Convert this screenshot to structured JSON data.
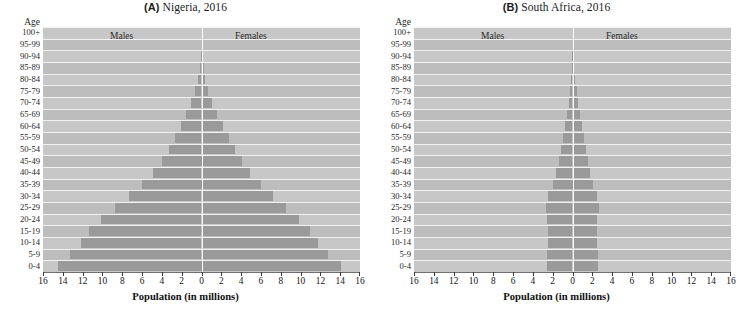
{
  "figure": {
    "x_axis_title": "Population (in millions)",
    "age_axis_title": "Age",
    "males_label": "Males",
    "females_label": "Females",
    "age_groups": [
      "100+",
      "95-99",
      "90-94",
      "85-89",
      "80-84",
      "75-79",
      "70-74",
      "65-69",
      "60-64",
      "55-59",
      "50-54",
      "45-49",
      "40-44",
      "35-39",
      "30-34",
      "25-29",
      "20-24",
      "15-19",
      "10-14",
      "5-9",
      "0-4"
    ],
    "x_ticks": [
      16,
      14,
      12,
      10,
      8,
      6,
      4,
      2,
      0,
      2,
      4,
      6,
      8,
      10,
      12,
      14,
      16
    ],
    "colors": {
      "bar": "#9a9a9a",
      "plot_background": "#c4c4c4",
      "gridline": "#f2f2f2",
      "centerline": "#fdfdfd",
      "text": "#141414"
    }
  },
  "chart_data": [
    {
      "type": "bar",
      "subtype": "population-pyramid",
      "panel": "A",
      "title": "(A) Nigeria, 2016",
      "country": "Nigeria",
      "year": 2016,
      "xlabel": "Population (in millions)",
      "ylabel": "Age",
      "xlim": [
        -16,
        16
      ],
      "xlim_display": [
        16,
        0,
        16
      ],
      "grid": true,
      "legend_position": "inside-top",
      "categories": [
        "100+",
        "95-99",
        "90-94",
        "85-89",
        "80-84",
        "75-79",
        "70-74",
        "65-69",
        "60-64",
        "55-59",
        "50-54",
        "45-49",
        "40-44",
        "35-39",
        "30-34",
        "25-29",
        "20-24",
        "15-19",
        "10-14",
        "5-9",
        "0-4"
      ],
      "series": [
        {
          "name": "Males",
          "values": [
            0.01,
            0.03,
            0.08,
            0.18,
            0.35,
            0.65,
            1.05,
            1.55,
            2.1,
            2.7,
            3.3,
            4.0,
            4.9,
            6.0,
            7.3,
            8.7,
            10.1,
            11.4,
            12.2,
            13.3,
            14.5
          ]
        },
        {
          "name": "Females",
          "values": [
            0.01,
            0.04,
            0.1,
            0.22,
            0.4,
            0.7,
            1.1,
            1.6,
            2.15,
            2.75,
            3.35,
            4.05,
            4.9,
            6.0,
            7.2,
            8.5,
            9.8,
            11.0,
            11.8,
            12.8,
            14.1
          ]
        }
      ]
    },
    {
      "type": "bar",
      "subtype": "population-pyramid",
      "panel": "B",
      "title": "(B) South Africa, 2016",
      "country": "South Africa",
      "year": 2016,
      "xlabel": "Population (in millions)",
      "ylabel": "Age",
      "xlim": [
        -16,
        16
      ],
      "xlim_display": [
        16,
        0,
        16
      ],
      "grid": true,
      "legend_position": "inside-top",
      "categories": [
        "100+",
        "95-99",
        "90-94",
        "85-89",
        "80-84",
        "75-79",
        "70-74",
        "65-69",
        "60-64",
        "55-59",
        "50-54",
        "45-49",
        "40-44",
        "35-39",
        "30-34",
        "25-29",
        "20-24",
        "15-19",
        "10-14",
        "5-9",
        "0-4"
      ],
      "series": [
        {
          "name": "Males",
          "values": [
            0.01,
            0.02,
            0.05,
            0.1,
            0.18,
            0.28,
            0.4,
            0.55,
            0.75,
            0.95,
            1.15,
            1.4,
            1.65,
            2.0,
            2.45,
            2.7,
            2.55,
            2.45,
            2.45,
            2.55,
            2.6
          ]
        },
        {
          "name": "Females",
          "values": [
            0.02,
            0.04,
            0.09,
            0.17,
            0.28,
            0.42,
            0.58,
            0.75,
            0.98,
            1.15,
            1.35,
            1.55,
            1.8,
            2.1,
            2.45,
            2.65,
            2.5,
            2.45,
            2.45,
            2.55,
            2.6
          ]
        }
      ]
    }
  ],
  "panels": [
    {
      "id": "a",
      "title_tag": "(A)",
      "title_rest": " Nigeria, 2016"
    },
    {
      "id": "b",
      "title_tag": "(B)",
      "title_rest": " South Africa, 2016"
    }
  ]
}
